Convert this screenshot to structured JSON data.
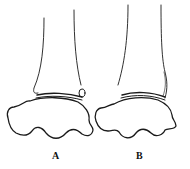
{
  "figure": {
    "panels": [
      {
        "label": "A",
        "description": "ankle joint drawing with small ossicle"
      },
      {
        "label": "B",
        "description": "ankle joint drawing with shaded fibula tip"
      }
    ]
  }
}
